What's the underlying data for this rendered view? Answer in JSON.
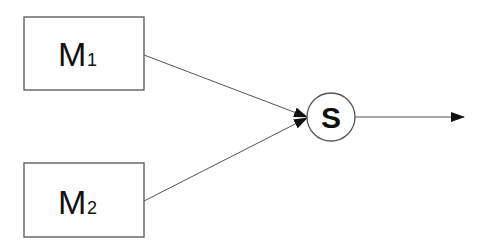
{
  "diagram": {
    "nodes": [
      {
        "id": "M1",
        "label_main": "M",
        "label_sub": "1",
        "shape": "rectangle"
      },
      {
        "id": "M2",
        "label_main": "M",
        "label_sub": "2",
        "shape": "rectangle"
      },
      {
        "id": "S",
        "label": "S",
        "shape": "circle"
      }
    ],
    "edges": [
      {
        "from": "M1",
        "to": "S",
        "arrow": true
      },
      {
        "from": "M2",
        "to": "S",
        "arrow": true
      },
      {
        "from": "S",
        "to": "output",
        "arrow": true
      }
    ],
    "colors": {
      "stroke": "#555555",
      "text": "#111111",
      "background": "#ffffff"
    }
  }
}
